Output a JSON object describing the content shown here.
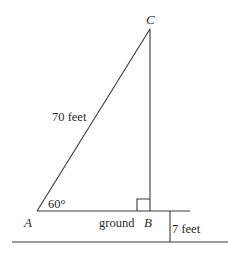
{
  "diagram": {
    "type": "right-triangle-elevation",
    "points": {
      "A": {
        "label": "A"
      },
      "B": {
        "label": "B"
      },
      "C": {
        "label": "C"
      }
    },
    "labels": {
      "hypotenuse": "70 feet",
      "angle_A": "60°",
      "ground": "ground",
      "height_offset": "7 feet"
    },
    "colors": {
      "line": "#3a3a3a",
      "text": "#2a2a2a",
      "background": "#ffffff"
    }
  }
}
